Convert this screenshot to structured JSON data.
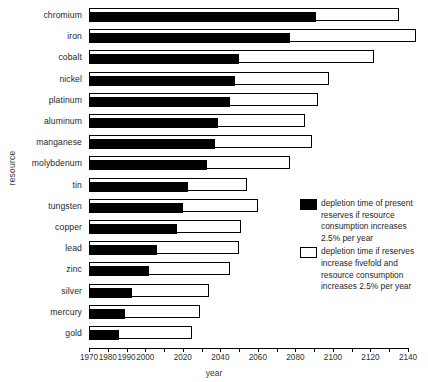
{
  "chart_data": {
    "type": "bar",
    "orientation": "horizontal",
    "title": "",
    "xlabel": "year",
    "ylabel": "resource",
    "xlim": [
      1970,
      2140
    ],
    "xticks": [
      1970,
      1980,
      1990,
      2000,
      2010,
      2020,
      2030,
      2040,
      2050,
      2060,
      2070,
      2080,
      2090,
      2100,
      2110,
      2120,
      2130,
      2140
    ],
    "xtick_labels": [
      "1970",
      "1980",
      "1990",
      "2000",
      "",
      "2020",
      "",
      "2040",
      "",
      "2060",
      "",
      "2080",
      "",
      "2100",
      "",
      "2120",
      "",
      "2140"
    ],
    "grid": false,
    "bar_start_year": 1970,
    "categories": [
      "chromium",
      "iron",
      "cobalt",
      "nickel",
      "platinum",
      "aluminum",
      "manganese",
      "molybdenum",
      "tin",
      "tungsten",
      "copper",
      "lead",
      "zinc",
      "silver",
      "mercury",
      "gold"
    ],
    "series": [
      {
        "name": "depletion time of present reserves if resource consumption increases 2.5% per year",
        "color": "#000000",
        "style": "filled",
        "values": [
          2091,
          2077,
          2050,
          2048,
          2045,
          2039,
          2037,
          2033,
          2023,
          2020,
          2017,
          2006,
          2002,
          1993,
          1989,
          1986
        ]
      },
      {
        "name": "depletion time if reserves increase fivefold and resource consumption increases 2.5% per year",
        "color": "#ffffff",
        "style": "hollow",
        "values": [
          2135,
          2144,
          2122,
          2098,
          2092,
          2085,
          2089,
          2077,
          2054,
          2060,
          2051,
          2050,
          2045,
          2034,
          2029,
          2025
        ]
      }
    ]
  },
  "axis": {
    "y_title": "resource",
    "x_title": "year"
  },
  "legend": {
    "items": [
      {
        "swatch": "filled-black-swatch",
        "label": "depletion time of present reserves if resource consumption increases 2.5% per year"
      },
      {
        "swatch": "hollow-white-swatch",
        "label": "depletion time if reserves increase fivefold and resource consumption increases 2.5% per year"
      }
    ]
  }
}
